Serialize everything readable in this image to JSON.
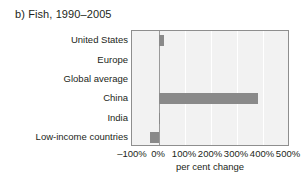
{
  "figure": {
    "title": "b) Fish, 1990–2005"
  },
  "axis": {
    "x_title": "per cent change",
    "ticks": [
      "–100%",
      "0%",
      "100%",
      "200%",
      "300%",
      "400%",
      "500%"
    ]
  },
  "colors": {
    "bar": "#8a8a8a",
    "plot_background": "#f2f2f2",
    "frame": "#8e8e8e",
    "gridline": "#ffffff",
    "zero_line": "#9a9a9a",
    "text": "#231f20"
  },
  "chart_data": {
    "type": "bar",
    "orientation": "horizontal",
    "title": "b) Fish, 1990–2005",
    "xlabel": "per cent change",
    "ylabel": "",
    "categories": [
      "United States",
      "Europe",
      "Global average",
      "China",
      "India",
      "Low-income countries"
    ],
    "values": [
      20,
      0,
      0,
      380,
      5,
      -35
    ],
    "xlim": [
      -100,
      500
    ],
    "xticks": [
      -100,
      0,
      100,
      200,
      300,
      400,
      500
    ],
    "xtick_labels": [
      "–100%",
      "0%",
      "100%",
      "200%",
      "300%",
      "400%",
      "500%"
    ],
    "grid": true,
    "grid_axis": "x",
    "legend": false,
    "units": "per cent"
  }
}
